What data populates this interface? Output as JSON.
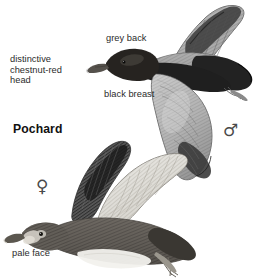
{
  "plate": {
    "background_color": "#ffffff",
    "width": 274,
    "height": 278,
    "species_name": "Pochard",
    "ink_color": "#2b2b2b"
  },
  "labels": {
    "chestnut_head": "distinctive\nchestnut-red\nhead",
    "grey_back": "grey back",
    "black_breast": "black breast",
    "pale_face": "pale face"
  },
  "symbols": {
    "male": "♂",
    "female": "♀"
  },
  "figures": {
    "male": {
      "sex": "male",
      "caption_labels": [
        "grey back",
        "black breast",
        "distinctive chestnut-red head"
      ]
    },
    "female": {
      "sex": "female",
      "caption_labels": [
        "pale face"
      ]
    }
  }
}
